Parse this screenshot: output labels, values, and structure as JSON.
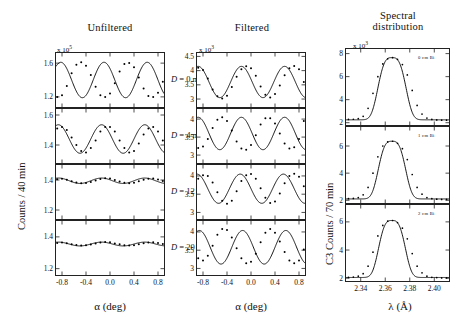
{
  "figure": {
    "columns": [
      {
        "id": "unfiltered",
        "title": "Unfiltered",
        "exponent_prefix": "x 10",
        "exponent": "5",
        "ylabel": "Counts / 40 min",
        "xlabel": "α  (deg)",
        "xticks": [
          "-0.8",
          "-0.4",
          "0.0",
          "0.4",
          "0.8"
        ]
      },
      {
        "id": "filtered",
        "title": "Filtered",
        "exponent_prefix": "x 10",
        "exponent": "3",
        "ylabel": "",
        "xlabel": "α  (deg)",
        "xticks": [
          "-0.8",
          "-0.4",
          "0.0",
          "0.4",
          "0.8"
        ]
      },
      {
        "id": "spectral",
        "title": "Spectral\ndistribution",
        "title_line1": "Spectral",
        "title_line2": "distribution",
        "exponent_prefix": "x 10",
        "exponent": "3",
        "ylabel": "C3 Counts / 70 min",
        "xlabel": "λ (Å)",
        "xticks": [
          "2.34",
          "2.36",
          "2.38",
          "2.40"
        ]
      }
    ],
    "panel_labels_left": [
      "D = 0 mm",
      "D = 4 mm",
      "D = 12 mm",
      "D = 20 mm"
    ],
    "panel_labels_inner_right": [
      "0 cm Bi",
      "1 cm Bi",
      "2 cm Bi"
    ]
  },
  "chart_data": [
    {
      "id": "unfiltered-D0",
      "type": "line",
      "title": "Unfiltered, D = 0 mm",
      "xlabel": "alpha (deg)",
      "ylabel": "Counts / 40 min (x 10^5)",
      "xlim": [
        -0.9,
        0.9
      ],
      "ylim": [
        1.08,
        1.72
      ],
      "yticks": [
        1.2,
        1.6
      ],
      "xticks": [
        -0.8,
        -0.4,
        0.0,
        0.4,
        0.8
      ],
      "fit": {
        "mean": 1.4,
        "amplitude": 0.21,
        "period": 0.72,
        "phase_deg": -0.82
      },
      "x": [
        -0.88,
        -0.8,
        -0.72,
        -0.64,
        -0.56,
        -0.48,
        -0.4,
        -0.32,
        -0.24,
        -0.16,
        -0.08,
        0.0,
        0.08,
        0.16,
        0.24,
        0.32,
        0.4,
        0.48,
        0.56,
        0.64,
        0.72,
        0.8,
        0.88
      ],
      "y": [
        1.2,
        1.22,
        1.33,
        1.48,
        1.58,
        1.61,
        1.57,
        1.46,
        1.32,
        1.22,
        1.2,
        1.24,
        1.36,
        1.5,
        1.59,
        1.6,
        1.55,
        1.43,
        1.3,
        1.21,
        1.2,
        1.25,
        1.38
      ]
    },
    {
      "id": "unfiltered-D4",
      "type": "line",
      "title": "Unfiltered, D = 4 mm",
      "xlabel": "alpha (deg)",
      "ylabel": "Counts / 40 min (x 10^5)",
      "xlim": [
        -0.9,
        0.9
      ],
      "ylim": [
        1.28,
        1.64
      ],
      "yticks": [
        1.4,
        1.6
      ],
      "xticks": [
        -0.8,
        -0.4,
        0.0,
        0.4,
        0.8
      ],
      "fit": {
        "mean": 1.44,
        "amplitude": 0.095,
        "period": 0.72,
        "phase_deg": -0.86
      },
      "x": [
        -0.88,
        -0.8,
        -0.72,
        -0.64,
        -0.56,
        -0.48,
        -0.4,
        -0.32,
        -0.24,
        -0.16,
        -0.08,
        0.0,
        0.08,
        0.16,
        0.24,
        0.32,
        0.4,
        0.48,
        0.56,
        0.64,
        0.72,
        0.8,
        0.88
      ],
      "y": [
        1.51,
        1.52,
        1.5,
        1.45,
        1.4,
        1.36,
        1.35,
        1.38,
        1.43,
        1.49,
        1.52,
        1.52,
        1.49,
        1.43,
        1.38,
        1.35,
        1.36,
        1.41,
        1.47,
        1.51,
        1.52,
        1.49,
        1.43
      ]
    },
    {
      "id": "unfiltered-D12",
      "type": "line",
      "title": "Unfiltered, D = 12 mm",
      "xlabel": "alpha (deg)",
      "ylabel": "Counts / 40 min (x 10^5)",
      "xlim": [
        -0.9,
        0.9
      ],
      "ylim": [
        1.14,
        1.5
      ],
      "yticks": [
        1.2,
        1.4
      ],
      "xticks": [
        -0.8,
        -0.4,
        0.0,
        0.4,
        0.8
      ],
      "fit": {
        "mean": 1.395,
        "amplitude": 0.018,
        "period": 0.72,
        "phase_deg": -0.86
      },
      "x": [
        -0.88,
        -0.8,
        -0.72,
        -0.64,
        -0.56,
        -0.48,
        -0.4,
        -0.32,
        -0.24,
        -0.16,
        -0.08,
        0.0,
        0.08,
        0.16,
        0.24,
        0.32,
        0.4,
        0.48,
        0.56,
        0.64,
        0.72,
        0.8,
        0.88
      ],
      "y": [
        1.405,
        1.408,
        1.402,
        1.392,
        1.384,
        1.379,
        1.38,
        1.387,
        1.396,
        1.406,
        1.412,
        1.41,
        1.4,
        1.39,
        1.381,
        1.378,
        1.382,
        1.391,
        1.401,
        1.409,
        1.41,
        1.404,
        1.394
      ]
    },
    {
      "id": "unfiltered-D20",
      "type": "line",
      "title": "Unfiltered, D = 20 mm",
      "xlabel": "alpha (deg)",
      "ylabel": "Counts / 40 min (x 10^5)",
      "xlim": [
        -0.9,
        0.9
      ],
      "ylim": [
        1.16,
        1.5
      ],
      "yticks": [
        1.2,
        1.4
      ],
      "xticks": [
        -0.8,
        -0.4,
        0.0,
        0.4,
        0.8
      ],
      "fit": {
        "mean": 1.355,
        "amplitude": 0.012,
        "period": 0.72,
        "phase_deg": -0.86
      },
      "x": [
        -0.88,
        -0.8,
        -0.72,
        -0.64,
        -0.56,
        -0.48,
        -0.4,
        -0.32,
        -0.24,
        -0.16,
        -0.08,
        0.0,
        0.08,
        0.16,
        0.24,
        0.32,
        0.4,
        0.48,
        0.56,
        0.64,
        0.72,
        0.8,
        0.88
      ],
      "y": [
        1.362,
        1.364,
        1.36,
        1.354,
        1.349,
        1.346,
        1.347,
        1.352,
        1.358,
        1.364,
        1.367,
        1.366,
        1.359,
        1.353,
        1.348,
        1.346,
        1.348,
        1.354,
        1.36,
        1.365,
        1.366,
        1.361,
        1.355
      ]
    },
    {
      "id": "filtered-D0",
      "type": "line",
      "title": "Filtered, D = 0 mm",
      "xlabel": "alpha (deg)",
      "ylabel": "Counts (x 10^3)",
      "xlim": [
        -0.9,
        0.9
      ],
      "ylim": [
        2.72,
        4.62
      ],
      "yticks": [
        3.0,
        3.5,
        4.0,
        4.5
      ],
      "xticks": [
        -0.8,
        -0.4,
        0.0,
        0.4,
        0.8
      ],
      "fit": {
        "mean": 3.6,
        "amplitude": 0.55,
        "period": 0.72,
        "phase_deg": -0.88
      },
      "x": [
        -0.88,
        -0.8,
        -0.72,
        -0.64,
        -0.56,
        -0.48,
        -0.4,
        -0.32,
        -0.24,
        -0.16,
        -0.08,
        0.0,
        0.08,
        0.16,
        0.24,
        0.32,
        0.4,
        0.48,
        0.56,
        0.64,
        0.72,
        0.8,
        0.88
      ],
      "y": [
        4.1,
        4.02,
        3.72,
        3.34,
        3.1,
        3.02,
        3.12,
        3.42,
        3.78,
        4.05,
        4.15,
        4.08,
        3.82,
        3.44,
        3.15,
        3.05,
        3.18,
        3.48,
        3.84,
        4.08,
        4.16,
        4.05,
        3.6
      ]
    },
    {
      "id": "filtered-D4",
      "type": "line",
      "title": "Filtered, D = 4 mm",
      "xlabel": "alpha (deg)",
      "ylabel": "Counts (x 10^3)",
      "xlim": [
        -0.9,
        0.9
      ],
      "ylim": [
        2.78,
        4.28
      ],
      "yticks": [
        3.0,
        3.5,
        4.0
      ],
      "xticks": [
        -0.8,
        -0.4,
        0.0,
        0.4,
        0.8
      ],
      "fit": {
        "mean": 3.6,
        "amplitude": 0.45,
        "period": 0.72,
        "phase_deg": -0.88
      },
      "x": [
        -0.88,
        -0.8,
        -0.72,
        -0.64,
        -0.56,
        -0.48,
        -0.4,
        -0.32,
        -0.24,
        -0.16,
        -0.08,
        0.0,
        0.08,
        0.16,
        0.24,
        0.32,
        0.4,
        0.48,
        0.56,
        0.64,
        0.72,
        0.8,
        0.88
      ],
      "y": [
        3.2,
        3.24,
        3.45,
        3.75,
        3.98,
        4.05,
        3.95,
        3.68,
        3.38,
        3.18,
        3.15,
        3.28,
        3.55,
        3.85,
        4.02,
        4.02,
        3.88,
        3.6,
        3.32,
        3.18,
        3.22,
        3.45,
        3.95
      ]
    },
    {
      "id": "filtered-D12",
      "type": "line",
      "title": "Filtered, D = 12 mm",
      "xlabel": "alpha (deg)",
      "ylabel": "Counts (x 10^3)",
      "xlim": [
        -0.9,
        0.9
      ],
      "ylim": [
        2.82,
        4.3
      ],
      "yticks": [
        3.0,
        3.5,
        4.0
      ],
      "xticks": [
        -0.8,
        -0.4,
        0.0,
        0.4,
        0.8
      ],
      "fit": {
        "mean": 3.65,
        "amplitude": 0.4,
        "period": 0.72,
        "phase_deg": -0.9
      },
      "x": [
        -0.88,
        -0.8,
        -0.72,
        -0.64,
        -0.56,
        -0.48,
        -0.4,
        -0.32,
        -0.24,
        -0.16,
        -0.08,
        0.0,
        0.08,
        0.16,
        0.24,
        0.32,
        0.4,
        0.48,
        0.56,
        0.64,
        0.72,
        0.8,
        0.88
      ],
      "y": [
        3.92,
        4.02,
        4.0,
        3.82,
        3.55,
        3.32,
        3.24,
        3.32,
        3.58,
        3.86,
        4.02,
        4.05,
        3.92,
        3.66,
        3.4,
        3.26,
        3.3,
        3.52,
        3.8,
        4.0,
        4.06,
        3.98,
        3.72
      ]
    },
    {
      "id": "filtered-D20",
      "type": "line",
      "title": "Filtered, D = 20 mm",
      "xlabel": "alpha (deg)",
      "ylabel": "Counts (x 10^3)",
      "xlim": [
        -0.9,
        0.9
      ],
      "ylim": [
        2.82,
        4.3
      ],
      "yticks": [
        3.0,
        3.5,
        4.0
      ],
      "xticks": [
        -0.8,
        -0.4,
        0.0,
        0.4,
        0.8
      ],
      "fit": {
        "mean": 3.58,
        "amplitude": 0.46,
        "period": 0.72,
        "phase_deg": -0.86
      },
      "x": [
        -0.88,
        -0.8,
        -0.72,
        -0.64,
        -0.56,
        -0.48,
        -0.4,
        -0.32,
        -0.24,
        -0.16,
        -0.08,
        0.0,
        0.08,
        0.16,
        0.24,
        0.32,
        0.4,
        0.48,
        0.56,
        0.64,
        0.72,
        0.8,
        0.88
      ],
      "y": [
        3.28,
        3.22,
        3.35,
        3.62,
        3.92,
        4.08,
        4.05,
        3.85,
        3.55,
        3.28,
        3.14,
        3.18,
        3.4,
        3.72,
        3.98,
        4.08,
        3.98,
        3.74,
        3.45,
        3.22,
        3.14,
        3.22,
        3.52
      ]
    },
    {
      "id": "spectral-0cmBi",
      "type": "line",
      "title": "Spectral distribution, 0 cm Bi",
      "xlabel": "lambda (A)",
      "ylabel": "C3 Counts / 70 min (x 10^3)",
      "xlim": [
        2.328,
        2.412
      ],
      "ylim": [
        1.8,
        8.4
      ],
      "yticks": [
        2,
        4,
        6,
        8
      ],
      "xticks": [
        2.34,
        2.36,
        2.38,
        2.4
      ],
      "peak": {
        "center": 2.3655,
        "height": 7.65,
        "width": 0.0105,
        "baseline": 2.25
      },
      "x": [
        2.33,
        2.334,
        2.338,
        2.342,
        2.346,
        2.35,
        2.354,
        2.358,
        2.362,
        2.366,
        2.37,
        2.374,
        2.378,
        2.382,
        2.386,
        2.39,
        2.394,
        2.398,
        2.402,
        2.406,
        2.41
      ],
      "y": [
        2.28,
        2.3,
        2.35,
        2.55,
        3.25,
        4.55,
        6.0,
        7.1,
        7.55,
        7.65,
        7.5,
        7.05,
        6.15,
        4.8,
        3.5,
        2.75,
        2.4,
        2.28,
        2.24,
        2.22,
        2.22
      ]
    },
    {
      "id": "spectral-1cmBi",
      "type": "line",
      "title": "Spectral distribution, 1 cm Bi",
      "xlabel": "lambda (A)",
      "ylabel": "C3 Counts / 70 min (x 10^3)",
      "xlim": [
        2.328,
        2.412
      ],
      "ylim": [
        1.8,
        7.4
      ],
      "yticks": [
        2,
        4,
        6
      ],
      "xticks": [
        2.34,
        2.36,
        2.38,
        2.4
      ],
      "peak": {
        "center": 2.3655,
        "height": 6.35,
        "width": 0.0102,
        "baseline": 2.1
      },
      "x": [
        2.33,
        2.334,
        2.338,
        2.342,
        2.346,
        2.35,
        2.354,
        2.358,
        2.362,
        2.366,
        2.37,
        2.374,
        2.378,
        2.382,
        2.386,
        2.39,
        2.394,
        2.398,
        2.402,
        2.406,
        2.41
      ],
      "y": [
        2.12,
        2.14,
        2.2,
        2.4,
        2.95,
        4.0,
        5.2,
        6.0,
        6.3,
        6.35,
        6.2,
        5.8,
        5.0,
        3.9,
        2.95,
        2.45,
        2.2,
        2.12,
        2.08,
        2.06,
        2.06
      ]
    },
    {
      "id": "spectral-2cmBi",
      "type": "line",
      "title": "Spectral distribution, 2 cm Bi",
      "xlabel": "lambda (A)",
      "ylabel": "C3 Counts / 70 min (x 10^3)",
      "xlim": [
        2.328,
        2.412
      ],
      "ylim": [
        1.8,
        7.2
      ],
      "yticks": [
        2,
        4,
        6
      ],
      "xticks": [
        2.34,
        2.36,
        2.38,
        2.4
      ],
      "peak": {
        "center": 2.3655,
        "height": 6.1,
        "width": 0.01,
        "baseline": 2.05
      },
      "x": [
        2.33,
        2.334,
        2.338,
        2.342,
        2.346,
        2.35,
        2.354,
        2.358,
        2.362,
        2.366,
        2.37,
        2.374,
        2.378,
        2.382,
        2.386,
        2.39,
        2.394,
        2.398,
        2.402,
        2.406,
        2.41
      ],
      "y": [
        2.06,
        2.08,
        2.14,
        2.32,
        2.85,
        3.85,
        5.0,
        5.75,
        6.05,
        6.1,
        5.95,
        5.55,
        4.8,
        3.75,
        2.85,
        2.38,
        2.14,
        2.06,
        2.04,
        2.02,
        2.02
      ]
    }
  ]
}
